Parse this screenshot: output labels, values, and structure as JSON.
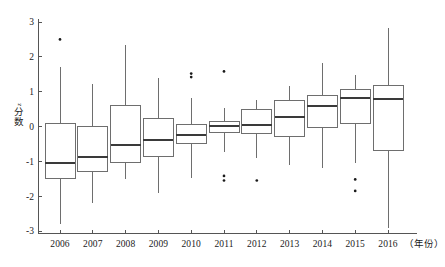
{
  "chart_data": {
    "type": "box",
    "title": "",
    "xlabel": "（年份）",
    "ylabel_parts": {
      "symbol": "z",
      "cjk_top": "分",
      "cjk_bottom": "数"
    },
    "ylabel": "z分数",
    "ylim": [
      -3,
      3
    ],
    "ytick_labels": [
      "3",
      "2",
      "1",
      "0",
      "-1",
      "-2",
      "-3"
    ],
    "ytick_values": [
      3,
      2,
      1,
      0,
      -1,
      -2,
      -3
    ],
    "grid": false,
    "legend": null,
    "categories": [
      "2006",
      "2007",
      "2008",
      "2009",
      "2010",
      "2011",
      "2012",
      "2013",
      "2014",
      "2015",
      "2016"
    ],
    "boxes": [
      {
        "category": "2006",
        "whisker_low": -2.8,
        "q1": -1.5,
        "median": -1.05,
        "q3": 0.08,
        "whisker_high": 1.72,
        "outliers": [
          2.5
        ]
      },
      {
        "category": "2007",
        "whisker_low": -2.2,
        "q1": -1.28,
        "median": -0.88,
        "q3": 0.0,
        "whisker_high": 1.21,
        "outliers": []
      },
      {
        "category": "2008",
        "whisker_low": -1.5,
        "q1": -1.03,
        "median": -0.54,
        "q3": 0.6,
        "whisker_high": 2.34,
        "outliers": []
      },
      {
        "category": "2009",
        "whisker_low": -1.9,
        "q1": -0.85,
        "median": -0.38,
        "q3": 0.22,
        "whisker_high": 1.4,
        "outliers": []
      },
      {
        "category": "2010",
        "whisker_low": -1.48,
        "q1": -0.48,
        "median": -0.23,
        "q3": 0.05,
        "whisker_high": 0.82,
        "outliers": [
          1.52,
          1.42
        ]
      },
      {
        "category": "2011",
        "whisker_low": -0.72,
        "q1": -0.18,
        "median": 0.02,
        "q3": 0.15,
        "whisker_high": 0.52,
        "outliers": [
          1.58,
          -1.42,
          -1.55
        ]
      },
      {
        "category": "2012",
        "whisker_low": -0.9,
        "q1": -0.2,
        "median": 0.05,
        "q3": 0.5,
        "whisker_high": 0.75,
        "outliers": [
          -1.55
        ]
      },
      {
        "category": "2013",
        "whisker_low": -1.1,
        "q1": -0.3,
        "median": 0.27,
        "q3": 0.75,
        "whisker_high": 1.15,
        "outliers": []
      },
      {
        "category": "2014",
        "whisker_low": -1.2,
        "q1": -0.02,
        "median": 0.6,
        "q3": 0.88,
        "whisker_high": 1.82,
        "outliers": []
      },
      {
        "category": "2015",
        "whisker_low": -1.05,
        "q1": 0.08,
        "median": 0.82,
        "q3": 1.07,
        "whisker_high": 1.48,
        "outliers": [
          -1.52,
          -1.85
        ]
      },
      {
        "category": "2016",
        "whisker_low": -2.9,
        "q1": -0.68,
        "median": 0.78,
        "q3": 1.18,
        "whisker_high": 2.82,
        "outliers": []
      }
    ]
  },
  "colors": {
    "axis": "#555555",
    "box_stroke": "#6e6e6e",
    "median": "#3a3a3a",
    "outlier": "#1a1a1a",
    "background": "#ffffff"
  }
}
